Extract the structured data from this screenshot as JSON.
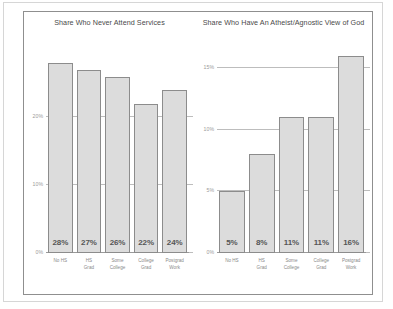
{
  "chart_data": [
    {
      "type": "bar",
      "title": "Share Who Never Attend Services",
      "xlabel": "",
      "ylabel": "",
      "categories": [
        "No HS",
        "HS\nGrad",
        "Some\nCollege",
        "College\nGrad",
        "Postgrad\nWork"
      ],
      "values": [
        28,
        27,
        26,
        22,
        24
      ],
      "data_labels": [
        "28%",
        "27%",
        "26%",
        "22%",
        "24%"
      ],
      "ylim": [
        0,
        32
      ],
      "yticks": [
        0,
        10,
        20
      ],
      "ytick_labels": [
        "0%",
        "10%",
        "20%"
      ],
      "grid": true,
      "legend": "none",
      "bar_color": "#dcdcdc",
      "bar_edge_color": "#8c8c8c"
    },
    {
      "type": "bar",
      "title": "Share Who Have An Atheist/Agnostic View of God",
      "xlabel": "",
      "ylabel": "",
      "categories": [
        "No HS",
        "HS\nGrad",
        "Some\nCollege",
        "College\nGrad",
        "Postgrad\nWork"
      ],
      "values": [
        5,
        8,
        11,
        11,
        16
      ],
      "data_labels": [
        "5%",
        "8%",
        "11%",
        "11%",
        "16%"
      ],
      "ylim": [
        0,
        17.6
      ],
      "yticks": [
        0,
        5,
        10,
        15
      ],
      "ytick_labels": [
        "0%",
        "5%",
        "10%",
        "15%"
      ],
      "grid": true,
      "legend": "none",
      "bar_color": "#dcdcdc",
      "bar_edge_color": "#8c8c8c"
    }
  ]
}
